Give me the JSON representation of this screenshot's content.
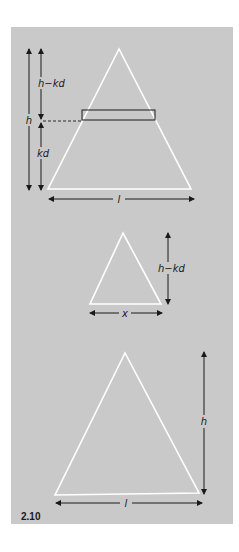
{
  "figure": {
    "number": "2.10",
    "background_color": "#c9c9c9",
    "triangle_color": "#ffffff",
    "line_color": "#1a1a1a"
  },
  "top_diagram": {
    "labels": {
      "outer_height": "h",
      "upper_segment": "h−kd",
      "lower_segment": "kd",
      "base": "l"
    },
    "has_strip_rectangle": true,
    "has_dashed_guide": true
  },
  "middle_diagram": {
    "labels": {
      "height": "h−kd",
      "base": "x"
    }
  },
  "bottom_diagram": {
    "labels": {
      "height": "h",
      "base": "l"
    }
  }
}
